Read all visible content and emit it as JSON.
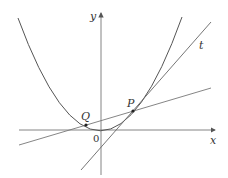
{
  "diagram": {
    "labels": {
      "y_axis": "y",
      "x_axis": "x",
      "origin": "0",
      "point_P": "P",
      "point_Q": "Q",
      "tangent": "t"
    },
    "colors": {
      "curve": "#555555",
      "lines": "#666666",
      "axes": "#555555",
      "text": "#333333"
    }
  }
}
